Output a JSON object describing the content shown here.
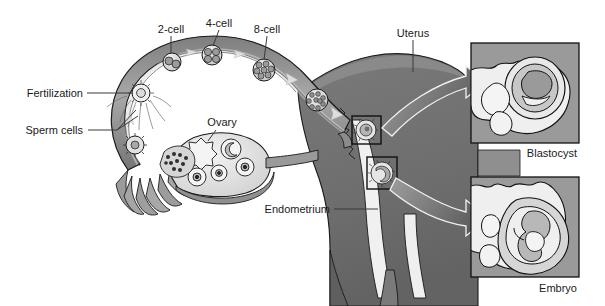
{
  "figure": {
    "type": "anatomical-diagram",
    "background_color": "#ffffff",
    "palette": {
      "outline": "#1a1a1a",
      "myometrium_dark": "#6f6f6f",
      "myometrium_mid": "#8a8a8a",
      "tube_mid": "#9a9a9a",
      "tube_light": "#c9c9c9",
      "endometrium_light": "#efefef",
      "inset_bg": "#9a9a9a",
      "inset_light": "#e8e8e8",
      "arrow_fill": "#6a6a6a",
      "label_text": "#1a1a1a"
    }
  },
  "labels": {
    "two_cell": "2-cell",
    "four_cell": "4-cell",
    "eight_cell": "8-cell",
    "uterus": "Uterus",
    "fertilization": "Fertilization",
    "sperm_cells": "Sperm cells",
    "ovary": "Ovary",
    "endometrium": "Endometrium",
    "blastocyst": "Blastocyst",
    "embryo": "Embryo"
  },
  "stages": [
    {
      "name": "2-cell",
      "label": "2-cell",
      "cells": 2,
      "x": 172,
      "y": 62,
      "label_x": 171,
      "label_y": 30
    },
    {
      "name": "4-cell",
      "label": "4-cell",
      "cells": 4,
      "x": 212,
      "y": 55,
      "label_x": 219,
      "label_y": 24
    },
    {
      "name": "8-cell",
      "label": "8-cell",
      "cells": 8,
      "x": 264,
      "y": 70,
      "label_x": 267,
      "label_y": 30
    },
    {
      "name": "morula",
      "label": "",
      "cells": 16,
      "x": 317,
      "y": 100,
      "label_x": 0,
      "label_y": 0
    }
  ],
  "insets": [
    {
      "name": "blastocyst",
      "caption": "Blastocyst",
      "x": 471,
      "y": 43,
      "width": 108,
      "height": 100,
      "caption_x": 577,
      "caption_y": 157
    },
    {
      "name": "embryo",
      "caption": "Embryo",
      "x": 471,
      "y": 177,
      "width": 108,
      "height": 100,
      "caption_x": 577,
      "caption_y": 292
    }
  ],
  "callout_boxes": [
    {
      "name": "implantation-site-blastocyst",
      "x": 352,
      "y": 116,
      "width": 29,
      "height": 28
    },
    {
      "name": "implantation-site-embryo",
      "x": 367,
      "y": 157,
      "width": 30,
      "height": 32
    }
  ],
  "ovary_follicles": [
    {
      "name": "primary-follicle",
      "cx": 203,
      "cy": 152,
      "r": 12
    },
    {
      "name": "secondary-follicle",
      "cx": 231,
      "cy": 149,
      "r": 10
    },
    {
      "name": "graafian-follicle",
      "cx": 243,
      "cy": 166,
      "r": 9
    },
    {
      "name": "ovum-follicle",
      "cx": 218,
      "cy": 172,
      "r": 8
    },
    {
      "name": "early-follicle",
      "cx": 197,
      "cy": 177,
      "r": 9
    },
    {
      "name": "corpus-luteum",
      "cx": 176,
      "cy": 160,
      "r": 11
    }
  ],
  "leaders": [
    {
      "name": "leader-two-cell",
      "points": "171,36 171,53"
    },
    {
      "name": "leader-four-cell",
      "points": "219,30 213,48"
    },
    {
      "name": "leader-eight-cell",
      "points": "267,36 264,60"
    },
    {
      "name": "leader-uterus",
      "points": "413,40 413,72"
    },
    {
      "name": "leader-fertilization",
      "points": "87,93 137,93"
    },
    {
      "name": "leader-sperm-cells",
      "points": "88,130 117,130 134,107"
    },
    {
      "name": "leader-sperm-cells-2",
      "points": "117,130 136,114"
    },
    {
      "name": "leader-ovary",
      "points": "216,129 207,142"
    },
    {
      "name": "leader-endometrium",
      "points": "334,209 378,209"
    }
  ],
  "big_arrows": [
    {
      "name": "arrow-to-blastocyst-inset",
      "from_x": 385,
      "from_y": 130,
      "to_x": 468,
      "to_y": 78
    },
    {
      "name": "arrow-to-embryo-inset",
      "from_x": 398,
      "from_y": 176,
      "to_x": 468,
      "to_y": 214
    }
  ],
  "flow_arrows": [
    {
      "name": "tube-flow-1",
      "x": 192,
      "y": 52
    },
    {
      "name": "tube-flow-2",
      "x": 240,
      "y": 53
    },
    {
      "name": "tube-flow-3",
      "x": 292,
      "y": 78
    },
    {
      "name": "tube-flow-4",
      "x": 337,
      "y": 112
    },
    {
      "name": "tube-flow-up",
      "x": 131,
      "y": 118
    }
  ]
}
